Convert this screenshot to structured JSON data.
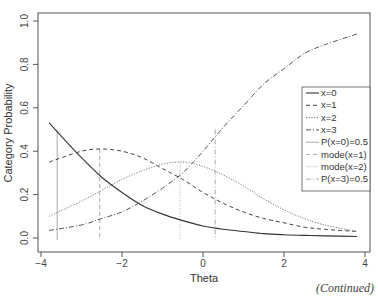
{
  "chart_data": {
    "type": "line",
    "title": "",
    "xlabel": "Theta",
    "ylabel": "Category Probability",
    "xlim": [
      -4,
      4
    ],
    "ylim": [
      0,
      1.0
    ],
    "xticks": [
      "−4",
      "−2",
      "0",
      "2",
      "4"
    ],
    "yticks": [
      "0.0",
      "0.2",
      "0.4",
      "0.6",
      "0.8",
      "1.0"
    ],
    "grid": false,
    "legend_position": "right-middle",
    "x": [
      -3.8,
      -3.0,
      -2.5,
      -2.0,
      -1.5,
      -1.0,
      -0.5,
      0.0,
      0.5,
      1.0,
      1.5,
      2.0,
      2.5,
      3.0,
      3.8
    ],
    "series": [
      {
        "name": "x=0",
        "style": "solid",
        "values": [
          0.53,
          0.37,
          0.28,
          0.21,
          0.15,
          0.11,
          0.08,
          0.055,
          0.04,
          0.03,
          0.02,
          0.015,
          0.012,
          0.01,
          0.007
        ]
      },
      {
        "name": "x=1",
        "style": "dashed",
        "values": [
          0.35,
          0.4,
          0.41,
          0.4,
          0.37,
          0.32,
          0.27,
          0.21,
          0.16,
          0.12,
          0.09,
          0.07,
          0.05,
          0.04,
          0.03
        ]
      },
      {
        "name": "x=2",
        "style": "dotted",
        "values": [
          0.1,
          0.17,
          0.22,
          0.27,
          0.31,
          0.34,
          0.35,
          0.33,
          0.29,
          0.24,
          0.18,
          0.13,
          0.09,
          0.06,
          0.03
        ]
      },
      {
        "name": "x=3",
        "style": "dotdash",
        "values": [
          0.035,
          0.06,
          0.09,
          0.12,
          0.17,
          0.23,
          0.3,
          0.4,
          0.51,
          0.61,
          0.71,
          0.78,
          0.85,
          0.89,
          0.94
        ]
      }
    ],
    "vertical_lines": [
      {
        "name": "P(x=0)=0.5",
        "x": -3.6,
        "y_top": 0.5,
        "style": "solid-light"
      },
      {
        "name": "mode(x=1)",
        "x": -2.55,
        "y_top": 0.41,
        "style": "dashed-light"
      },
      {
        "name": "mode(x=2)",
        "x": -0.57,
        "y_top": 0.35,
        "style": "dotted-light"
      },
      {
        "name": "P(x=3)=0.5",
        "x": 0.3,
        "y_top": 0.5,
        "style": "dotdash-light"
      }
    ]
  },
  "legend": {
    "items": [
      {
        "label": "x=0"
      },
      {
        "label": "x=1"
      },
      {
        "label": "x=2"
      },
      {
        "label": "x=3"
      },
      {
        "label": "P(x=0)=0.5"
      },
      {
        "label": "mode(x=1)"
      },
      {
        "label": "mode(x=2)"
      },
      {
        "label": "P(x=3)=0.5"
      }
    ]
  },
  "footer": {
    "continued": "(Continued)"
  }
}
